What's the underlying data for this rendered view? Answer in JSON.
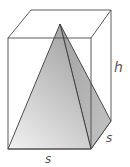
{
  "figure": {
    "labels": {
      "height": "h",
      "depth_side": "s",
      "base_side": "s"
    },
    "colors": {
      "edge": "#3a3a3a",
      "box_edge": "#4a4a4a",
      "pyramid_front_light": "#e8e8e8",
      "pyramid_front_dark": "#a8a8a8",
      "pyramid_side": "#b0b0b0",
      "background": "#ffffff"
    }
  }
}
